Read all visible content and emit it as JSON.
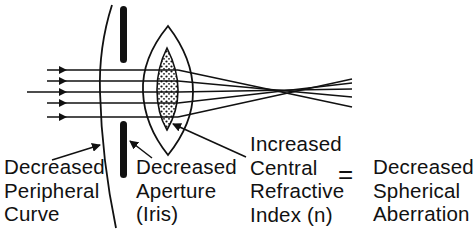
{
  "diagram": {
    "labels": {
      "peripheral_curve": [
        "Decreased",
        "Peripheral",
        "Curve"
      ],
      "aperture": [
        "Decreased",
        "Aperture",
        "(Iris)"
      ],
      "refractive_index": [
        "Increased",
        "Central",
        "Refractive",
        "Index (n)"
      ],
      "equals": "=",
      "result": [
        "Decreased",
        "Spherical",
        "Aberration"
      ]
    },
    "elements": {
      "cornea": "peripheral-curve",
      "iris": "aperture-stop",
      "lens": "crystalline-lens",
      "nucleus": "lens-nucleus-high-index",
      "rays": 5,
      "focal_point": "convergence-point"
    },
    "colors": {
      "ink": "#111111",
      "background": "#ffffff"
    }
  }
}
